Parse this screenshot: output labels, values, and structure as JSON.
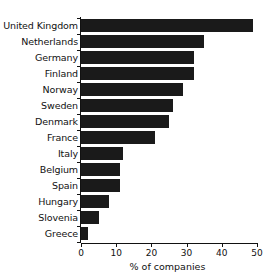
{
  "chart_data": {
    "type": "bar",
    "orientation": "horizontal",
    "title": "",
    "xlabel": "% of companies",
    "ylabel": "",
    "categories": [
      "United Kingdom",
      "Netherlands",
      "Germany",
      "Finland",
      "Norway",
      "Sweden",
      "Denmark",
      "France",
      "Italy",
      "Belgium",
      "Spain",
      "Hungary",
      "Slovenia",
      "Greece"
    ],
    "values": [
      49,
      35,
      32,
      32,
      29,
      26,
      25,
      21,
      12,
      11,
      11,
      8,
      5,
      2
    ],
    "xlim": [
      0,
      50
    ],
    "xticks": [
      0,
      10,
      20,
      30,
      40,
      50
    ],
    "xtick_labels": [
      "0",
      "10",
      "20",
      "30",
      "40",
      "50"
    ],
    "grid": false,
    "legend": false,
    "bar_color": "#1a1a1a",
    "axis_color": "#111111",
    "background": "#ffffff"
  }
}
